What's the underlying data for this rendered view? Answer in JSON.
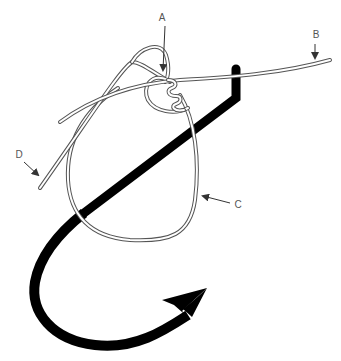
{
  "diagram": {
    "type": "fishing-knot-illustration",
    "colors": {
      "hook": "#000000",
      "line_outline": "#555555",
      "line_fill": "#ffffff",
      "label": "#555555",
      "background": "#ffffff"
    },
    "labels": [
      {
        "id": "A",
        "text": "A",
        "points_to": "knot wraps"
      },
      {
        "id": "B",
        "text": "B",
        "points_to": "standing line"
      },
      {
        "id": "C",
        "text": "C",
        "points_to": "loop"
      },
      {
        "id": "D",
        "text": "D",
        "points_to": "tag end"
      }
    ]
  }
}
